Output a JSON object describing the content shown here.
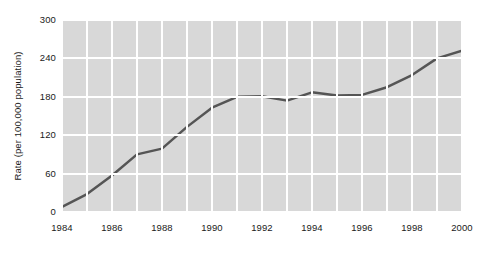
{
  "chart_data": {
    "type": "line",
    "title": "",
    "xlabel": "",
    "ylabel": "Rate (per 100,000 population)",
    "xlim": [
      1984,
      2000
    ],
    "ylim": [
      0,
      300
    ],
    "ytick_labels": [
      "300",
      "240",
      "180",
      "120",
      "60",
      "0"
    ],
    "ytick_values": [
      300,
      240,
      180,
      120,
      60,
      0
    ],
    "xtick_labels": [
      "1984",
      "1986",
      "1988",
      "1990",
      "1992",
      "1994",
      "1996",
      "1998",
      "2000"
    ],
    "xtick_values": [
      1984,
      1986,
      1988,
      1990,
      1992,
      1994,
      1996,
      1998,
      2000
    ],
    "grid": true,
    "grid_color": "#ffffff",
    "plot_background": "#d8d8d8",
    "legend": null,
    "series": [
      {
        "name": "Rate",
        "color": "#555555",
        "line_width": 2.5,
        "x": [
          1984,
          1985,
          1986,
          1987,
          1988,
          1989,
          1990,
          1991,
          1992,
          1993,
          1994,
          1995,
          1996,
          1997,
          1998,
          1999,
          2000
        ],
        "values": [
          8,
          28,
          57,
          90,
          99,
          133,
          163,
          180,
          181,
          174,
          187,
          182,
          183,
          195,
          214,
          240,
          252
        ]
      }
    ]
  }
}
